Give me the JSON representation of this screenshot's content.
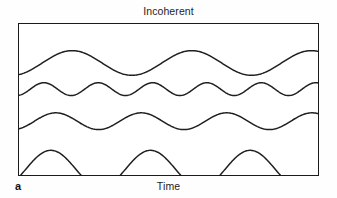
{
  "figure": {
    "title": "Incoherent",
    "panel_letter": "a",
    "x_axis_label": "Time",
    "background_color": "#ffffff",
    "border_color": "#1b1b1b",
    "stroke_color": "#1f1f1f"
  },
  "chart_data": {
    "type": "line",
    "title": "Incoherent",
    "subtitle": "",
    "xlabel": "Time",
    "ylabel": "",
    "annotations": [
      "a"
    ],
    "grid": false,
    "legend": "none",
    "axis_ticks": false,
    "xlim": [
      0,
      1
    ],
    "ylim": [
      0,
      153
    ],
    "series": [
      {
        "name": "wave-1",
        "cycles": 2.5,
        "amplitude": 12.5,
        "baseline": 27,
        "phase_deg": 200,
        "stroke_width": 1.5
      },
      {
        "name": "wave-2",
        "cycles": 5.5,
        "amplitude": 6.5,
        "baseline": 59.5,
        "phase_deg": 195,
        "stroke_width": 1.5
      },
      {
        "name": "wave-3",
        "cycles": 3.5,
        "amplitude": 8.5,
        "baseline": 90,
        "phase_deg": 205,
        "stroke_width": 1.5
      },
      {
        "name": "wave-4",
        "cycles": 3.0,
        "amplitude": 19,
        "baseline": 128,
        "phase_deg": 245,
        "stroke_width": 1.5
      }
    ]
  }
}
